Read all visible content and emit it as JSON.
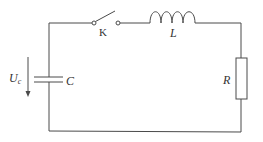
{
  "diagram": {
    "type": "RLC series circuit",
    "components": {
      "switch": {
        "label": "K"
      },
      "inductor": {
        "label": "L"
      },
      "resistor": {
        "label": "R"
      },
      "capacitor": {
        "label": "C"
      }
    },
    "voltage": {
      "symbol": "U",
      "subscript": "c",
      "direction": "downward arrow"
    },
    "colors": {
      "line": "#4a4a4a",
      "text": "#333333",
      "background": "#ffffff"
    }
  }
}
